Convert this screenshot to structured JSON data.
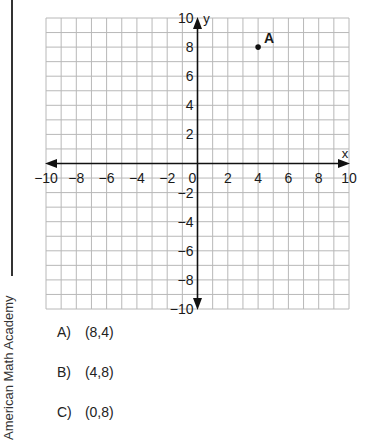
{
  "chart_data": {
    "type": "scatter",
    "title": "",
    "xlabel": "x",
    "ylabel": "y",
    "xlim": [
      -10,
      10
    ],
    "ylim": [
      -10,
      10
    ],
    "grid": true,
    "grid_step": 1,
    "x_ticks": [
      -10,
      -8,
      -6,
      -4,
      -2,
      0,
      2,
      4,
      6,
      8,
      10
    ],
    "y_ticks": [
      -10,
      -8,
      -6,
      -4,
      -2,
      2,
      4,
      6,
      8,
      10
    ],
    "points": [
      {
        "label": "A",
        "x": 4,
        "y": 8
      }
    ]
  },
  "side_label": "American Math Academy",
  "choices": [
    {
      "letter": "A)",
      "text": "(8,4)"
    },
    {
      "letter": "B)",
      "text": "(4,8)"
    },
    {
      "letter": "C)",
      "text": "(0,8)"
    }
  ],
  "colors": {
    "grid": "#b8b8b8",
    "axis": "#111111",
    "text": "#1a1a1a"
  }
}
